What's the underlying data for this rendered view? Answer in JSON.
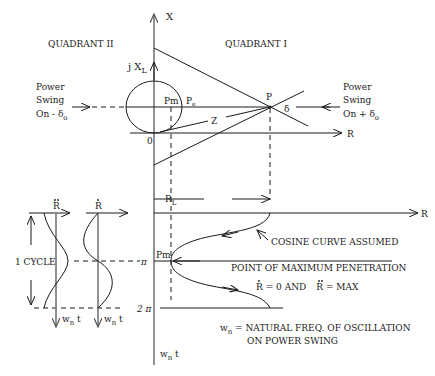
{
  "diagram": {
    "axes": {
      "x_axis_label": "X",
      "jxl_label": "j X",
      "jxl_sub": "L",
      "r_axis_label": "R",
      "r_axis_lower_label": "R",
      "time_axis_label": "w",
      "time_axis_sub": "n",
      "time_axis_suffix": " t",
      "origin_label": "0"
    },
    "quadrants": {
      "q2": "QUADRANT II",
      "q1": "QUADRANT I"
    },
    "points": {
      "p": "P",
      "pm": "Pm",
      "pe": "P",
      "pe_sub": "e",
      "z": "Z",
      "delta": "δ",
      "pm_lower": "Pm"
    },
    "power_swing_left": {
      "line1": "Power",
      "line2": "Swing",
      "line3": "On - δ",
      "sub": "o"
    },
    "power_swing_right": {
      "line1": "Power",
      "line2": "Swing",
      "line3": "On + δ",
      "sub": "o"
    },
    "lower": {
      "rl_label": "R",
      "rl_sub": "L",
      "pi_label": "π",
      "two_pi_label": "2 π",
      "cycle_label": "1 CYCLE",
      "rddot_label": "R",
      "rdot_label": "R",
      "cosine_note": "COSINE CURVE ASSUMED",
      "max_pen_note": "POINT OF MAXIMUM PENETRATION",
      "cond_rdot": "R",
      "cond_rdot_val": " = 0   AND",
      "cond_rddot": "R",
      "cond_rddot_val": " = MAX",
      "wn_def_lhs": "w",
      "wn_def_sub": "n",
      "wn_def_line1": " =  NATURAL FREQ. OF OSCILLATION",
      "wn_def_line2": "ON POWER SWING"
    }
  }
}
